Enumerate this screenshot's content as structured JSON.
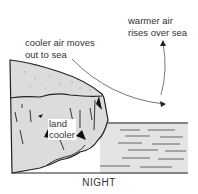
{
  "diagram": {
    "title": "NIGHT",
    "labels": {
      "cool_air_line1": "cooler air moves",
      "cool_air_line2": "out to sea",
      "warm_air_line1": "warmer air",
      "warm_air_line2": "rises over sea",
      "land_line1": "land",
      "land_line2": "cooler"
    },
    "elements": [
      "cliff-land",
      "sea-water",
      "cool-air-arrow",
      "warm-air-arrow"
    ],
    "colors": {
      "ink": "#222222",
      "land_fill": "#dcdcdc",
      "sea_fill": "#e4e4e4"
    }
  }
}
